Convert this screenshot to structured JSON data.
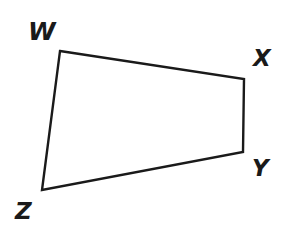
{
  "figure": {
    "kind": "quadrilateral",
    "name": "WXYZ",
    "stroke_color": "#1a1a1a",
    "fill_color": "#ffffff",
    "background_color": "#ffffff",
    "stroke_width": 2.4,
    "vertices": [
      {
        "label": "W",
        "x": 60,
        "y": 51
      },
      {
        "label": "X",
        "x": 244,
        "y": 79
      },
      {
        "label": "Y",
        "x": 243,
        "y": 152
      },
      {
        "label": "Z",
        "x": 42,
        "y": 190
      }
    ],
    "edges": [
      {
        "name": "WX",
        "from": "W",
        "to": "X"
      },
      {
        "name": "XY",
        "from": "X",
        "to": "Y"
      },
      {
        "name": "YZ",
        "from": "Y",
        "to": "Z"
      },
      {
        "name": "ZW",
        "from": "Z",
        "to": "W"
      }
    ],
    "labels": {
      "W": "W",
      "X": "X",
      "Y": "Y",
      "Z": "Z"
    },
    "path_d": "M 60 51 L 244 79 L 243 152 L 42 190 Z"
  }
}
